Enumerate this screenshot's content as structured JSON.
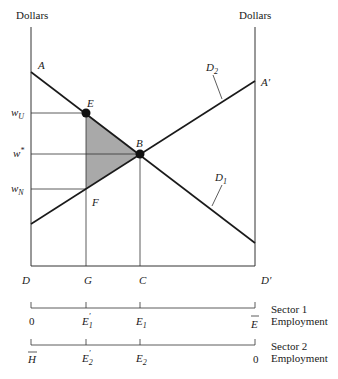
{
  "axes": {
    "left_label": "Dollars",
    "right_label": "Dollars"
  },
  "points": {
    "A": "A",
    "A_prime": "A′",
    "E": "E",
    "B": "B",
    "F": "F",
    "D": "D",
    "G": "G",
    "C": "C",
    "D_prime": "D′"
  },
  "curves": {
    "D1": {
      "main": "D",
      "sub": "1"
    },
    "D2": {
      "main": "D",
      "sub": "2"
    }
  },
  "wages": {
    "wU": {
      "main": "w",
      "sub": "U"
    },
    "wstar": {
      "main": "w",
      "sup": "*"
    },
    "wN": {
      "main": "w",
      "sub": "N"
    }
  },
  "sector1": {
    "title_line1": "Sector 1",
    "title_line2": "Employment",
    "ticks": [
      {
        "main": "0",
        "sub": ""
      },
      {
        "main": "E",
        "sub": "1",
        "prime": "′"
      },
      {
        "main": "E",
        "sub": "1",
        "prime": ""
      },
      {
        "main": "E",
        "bar": true
      }
    ]
  },
  "sector2": {
    "title_line1": "Sector 2",
    "title_line2": "Employment",
    "ticks": [
      {
        "main": "H",
        "bar": true
      },
      {
        "main": "E",
        "sub": "2",
        "prime": "′"
      },
      {
        "main": "E",
        "sub": "2",
        "prime": ""
      },
      {
        "main": "0",
        "sub": ""
      }
    ]
  },
  "colors": {
    "shaded_triangle": "#a9a9a9",
    "lines": "#1a1a1a"
  }
}
